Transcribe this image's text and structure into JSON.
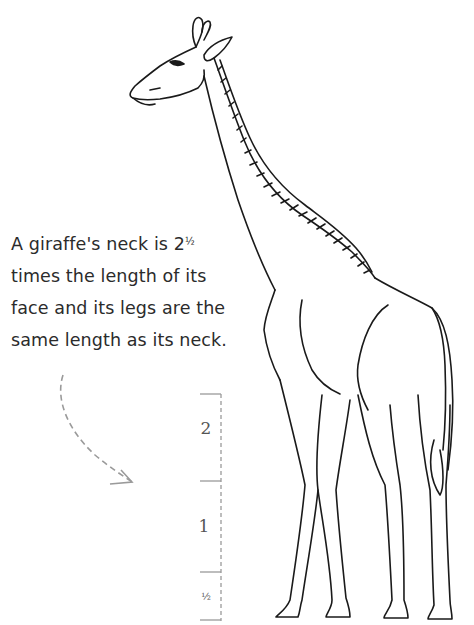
{
  "caption": {
    "lines": [
      "A giraffe's neck is 2",
      "times the length of its",
      "face and its legs are the",
      "same length as its neck."
    ],
    "fraction": "½"
  },
  "scale": {
    "labels": [
      "2",
      "1",
      "½"
    ]
  },
  "illustration": {
    "subject": "giraffe line drawing",
    "stroke_color": "#1a1a1a",
    "guide_color": "#9a9a9a"
  }
}
